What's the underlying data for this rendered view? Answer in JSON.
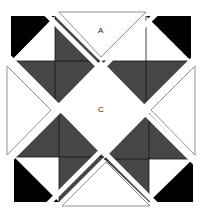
{
  "diagram": {
    "type": "quilt-block",
    "labels": {
      "a": "A",
      "c": "C"
    },
    "colors": {
      "dark": "#464646",
      "black": "#000000",
      "light": "#ffffff",
      "outline": "#777777"
    }
  }
}
